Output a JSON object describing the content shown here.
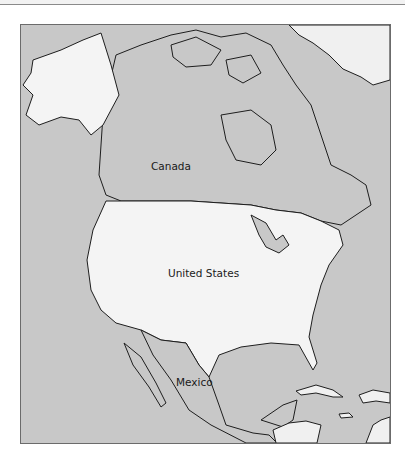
{
  "map": {
    "water_color": "#c8c8c8",
    "highlight_land_color": "#f4f4f4",
    "other_land_color": "#c8c8c8",
    "border_color": "#1e1e1e",
    "labels": {
      "canada": "Canada",
      "united_states": "United States",
      "mexico": "Mexico"
    }
  }
}
